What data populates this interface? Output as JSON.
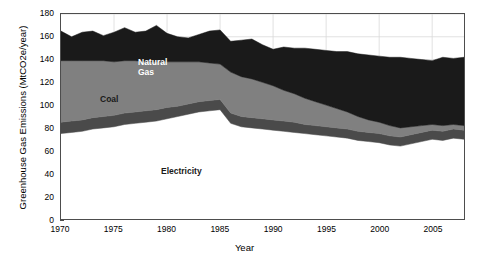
{
  "chart_data": {
    "type": "area",
    "stacked": true,
    "title": "",
    "xlabel": "Year",
    "ylabel": "Greenhouse Gas Emissions (MtCO2e/year)",
    "xlim": [
      1970,
      2008
    ],
    "ylim": [
      0,
      180
    ],
    "xticks": [
      1970,
      1975,
      1980,
      1985,
      1990,
      1995,
      2000,
      2005
    ],
    "yticks": [
      0,
      20,
      40,
      60,
      80,
      100,
      120,
      140,
      160,
      180
    ],
    "grid": true,
    "legend_position": "inline-annotations",
    "x": [
      1970,
      1971,
      1972,
      1973,
      1974,
      1975,
      1976,
      1977,
      1978,
      1979,
      1980,
      1981,
      1982,
      1983,
      1984,
      1985,
      1986,
      1987,
      1988,
      1989,
      1990,
      1991,
      1992,
      1993,
      1994,
      1995,
      1996,
      1997,
      1998,
      1999,
      2000,
      2001,
      2002,
      2003,
      2004,
      2005,
      2006,
      2007,
      2008
    ],
    "series": [
      {
        "name": "Electricity",
        "color": "#ffffff",
        "label_color": "#1a1a1a",
        "values": [
          75,
          76,
          77,
          79,
          80,
          81,
          83,
          84,
          85,
          86,
          88,
          90,
          92,
          94,
          95,
          96,
          84,
          81,
          80,
          79,
          78,
          77,
          76,
          75,
          74,
          73,
          72,
          71,
          69,
          68,
          67,
          65,
          64,
          66,
          68,
          70,
          69,
          71,
          70
        ]
      },
      {
        "name": "Oil",
        "color": "#4a4a4a",
        "label_color": "#ffffff",
        "values": [
          10,
          10,
          10,
          10,
          10,
          10,
          10,
          10,
          10,
          10,
          10,
          9,
          9,
          9,
          9,
          9,
          9,
          9,
          9,
          9,
          9,
          9,
          9,
          8,
          8,
          8,
          8,
          8,
          8,
          8,
          8,
          8,
          8,
          8,
          8,
          8,
          8,
          8,
          8
        ]
      },
      {
        "name": "Coal",
        "color": "#808080",
        "label_color": "#1a1a1a",
        "values": [
          54,
          53,
          52,
          50,
          49,
          47,
          46,
          45,
          43,
          42,
          40,
          39,
          37,
          35,
          33,
          31,
          36,
          35,
          34,
          32,
          30,
          27,
          25,
          23,
          21,
          19,
          17,
          15,
          13,
          11,
          10,
          9,
          8,
          7,
          6,
          5,
          5,
          4,
          4
        ]
      },
      {
        "name": "Natural Gas",
        "color": "#1a1a1a",
        "label_color": "#ffffff",
        "values": [
          26,
          21,
          25,
          26,
          22,
          26,
          29,
          25,
          27,
          32,
          25,
          22,
          21,
          24,
          28,
          30,
          27,
          32,
          35,
          33,
          32,
          38,
          40,
          44,
          46,
          48,
          50,
          53,
          55,
          57,
          58,
          60,
          62,
          60,
          58,
          56,
          60,
          58,
          60
        ]
      }
    ],
    "annotations": [
      {
        "text": "Natural\nGas",
        "x_px": 138,
        "y_px": 58
      },
      {
        "text": "Coal",
        "x_px": 100,
        "y_px": 95
      },
      {
        "text": "Oil",
        "x_px": 113,
        "y_px": 127
      },
      {
        "text": "Electricity",
        "x_px": 161,
        "y_px": 167
      }
    ]
  },
  "axes": {
    "frame_color": "#4d4d4d",
    "grid_color": "#d9d9d9",
    "background": "#ffffff"
  }
}
